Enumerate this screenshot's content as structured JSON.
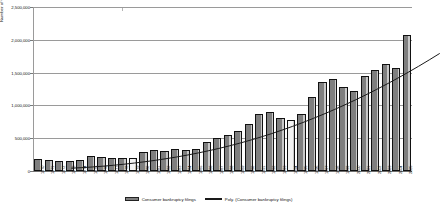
{
  "chart_data": {
    "type": "bar",
    "title": "",
    "xlabel": "",
    "ylabel": "Number of Cases",
    "ylim": [
      0,
      2500000
    ],
    "ytick_labels": [
      "2,500,000",
      "2,000,000",
      "1,500,000",
      "1,000,000",
      "500,000",
      "0"
    ],
    "ytick_values": [
      2500000,
      2000000,
      1500000,
      1000000,
      500000,
      0
    ],
    "grid": true,
    "legend_position": "bottom",
    "categories": [
      "1970",
      "1971",
      "1972",
      "1973",
      "1974",
      "1975",
      "1976",
      "1977",
      "1978",
      "1979",
      "1980",
      "1981",
      "1982",
      "1983",
      "1984",
      "1985",
      "1986",
      "1987",
      "1988",
      "1989",
      "1990",
      "1991",
      "1992",
      "1993",
      "1994",
      "1995",
      "1996",
      "1997",
      "1998",
      "1999",
      "2000",
      "2001",
      "2002",
      "2003",
      "2004",
      "2005"
    ],
    "series": [
      {
        "name": "Consumer bankruptcy filings",
        "type": "bar",
        "values": [
          178000,
          171000,
          157000,
          159000,
          168000,
          224000,
          212000,
          196000,
          197000,
          204000,
          287000,
          315000,
          311000,
          330000,
          317000,
          341000,
          449000,
          496000,
          550000,
          617000,
          719000,
          873000,
          900000,
          812000,
          780000,
          874000,
          1125000,
          1350000,
          1398000,
          1281000,
          1217000,
          1452000,
          1539000,
          1625000,
          1563000,
          2080000
        ]
      },
      {
        "name": "Poly. (Consumer bankruptcy filings)",
        "type": "line",
        "values": [
          150000,
          158000,
          168000,
          180000,
          194000,
          210000,
          228000,
          248000,
          270000,
          294000,
          320000,
          349000,
          380000,
          414000,
          450000,
          489000,
          531000,
          576000,
          624000,
          675000,
          729000,
          786000,
          846000,
          909000,
          975000,
          1044000,
          1116000,
          1191000,
          1269000,
          1350000,
          1434000,
          1521000,
          1611000,
          1704000,
          1800000,
          1899000
        ]
      }
    ],
    "legend": [
      {
        "label": "Consumer bankruptcy filings",
        "marker": "bar-swatch",
        "color": "#7f7f7f"
      },
      {
        "label": "Poly. (Consumer bankruptcy filings)",
        "marker": "line",
        "color": "#1a1a1a"
      }
    ],
    "highlighted_categories": [
      "1979",
      "1994"
    ]
  }
}
